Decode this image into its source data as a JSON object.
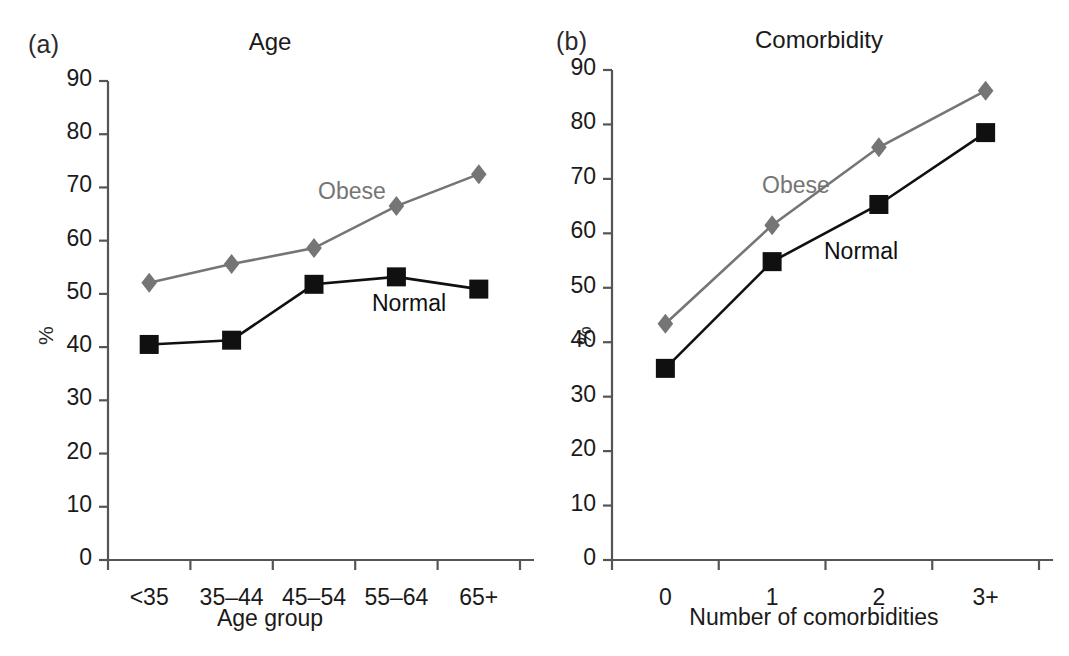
{
  "figure": {
    "panels": [
      {
        "tag": "(a)",
        "title": "Age",
        "xlabel": "Age group",
        "ylabel": "%",
        "series_labels": {
          "obese": "Obese",
          "normal": "Normal"
        }
      },
      {
        "tag": "(b)",
        "title": "Comorbidity",
        "xlabel": "Number of comorbidities",
        "ylabel": "%",
        "series_labels": {
          "obese": "Obese",
          "normal": "Normal"
        }
      }
    ]
  },
  "colors": {
    "obese": "#757575",
    "normal": "#101010",
    "axis": "#555555",
    "text": "#1a1a1a",
    "background": "#ffffff"
  },
  "chart_data": [
    {
      "type": "line",
      "panel": "(a)",
      "title": "Age",
      "xlabel": "Age group",
      "ylabel": "%",
      "categories": [
        "<35",
        "35–44",
        "45–54",
        "55–64",
        "65+"
      ],
      "ylim": [
        0,
        90
      ],
      "yticks": [
        0,
        10,
        20,
        30,
        40,
        50,
        60,
        70,
        80,
        90
      ],
      "grid": false,
      "legend": "inline-annotations",
      "series": [
        {
          "name": "Obese",
          "values": [
            52.1,
            55.6,
            58.6,
            66.5,
            72.5
          ],
          "marker": "diamond",
          "color": "#757575"
        },
        {
          "name": "Normal",
          "values": [
            40.5,
            41.3,
            51.8,
            53.2,
            50.9
          ],
          "marker": "square",
          "color": "#101010"
        }
      ],
      "annotations": [
        {
          "text": "Obese",
          "near": "between 45–54 and 55–64, above line"
        },
        {
          "text": "Normal",
          "near": "between 55–64 and 65+, below line"
        }
      ]
    },
    {
      "type": "line",
      "panel": "(b)",
      "title": "Comorbidity",
      "xlabel": "Number of comorbidities",
      "ylabel": "%",
      "categories": [
        "0",
        "1",
        "2",
        "3+"
      ],
      "ylim": [
        0,
        90
      ],
      "yticks": [
        0,
        10,
        20,
        30,
        40,
        50,
        60,
        70,
        80,
        90
      ],
      "grid": false,
      "legend": "inline-annotations",
      "series": [
        {
          "name": "Obese",
          "values": [
            43.4,
            61.5,
            75.8,
            86.2
          ],
          "marker": "diamond",
          "color": "#757575"
        },
        {
          "name": "Normal",
          "values": [
            35.2,
            54.8,
            65.3,
            78.5
          ],
          "marker": "square",
          "color": "#101010"
        }
      ],
      "annotations": [
        {
          "text": "Obese",
          "near": "between 1 and 2, above line"
        },
        {
          "text": "Normal",
          "near": "between 1 and 2, below line"
        }
      ]
    }
  ]
}
